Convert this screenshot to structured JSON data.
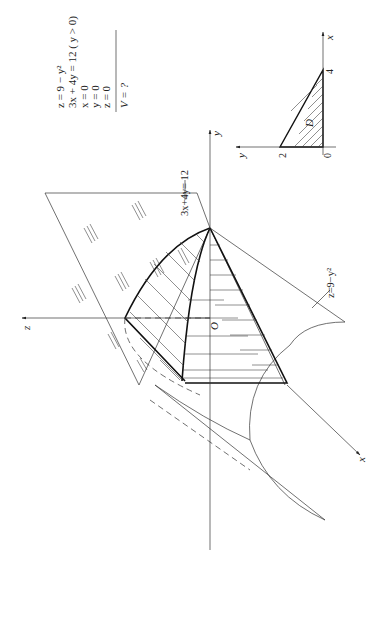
{
  "given": {
    "equations": [
      "z = 9 − y²",
      "3x + 4y = 12 ( y > 0)",
      "x = 0",
      "y = 0",
      "z = 0"
    ],
    "question": "V = ?"
  },
  "figure3d": {
    "axis_labels": {
      "x": "x",
      "y": "y",
      "z": "z"
    },
    "origin_label": "O",
    "plane_label": "3x+4y= 12",
    "surface_label": "z=9−y²"
  },
  "figure2d": {
    "axis_labels": {
      "x": "x",
      "y": "y"
    },
    "ticks": {
      "x": "4",
      "y": "2",
      "origin": "0"
    },
    "region_label": "D"
  },
  "colors": {
    "ink": "#222222",
    "background": "#ffffff"
  }
}
